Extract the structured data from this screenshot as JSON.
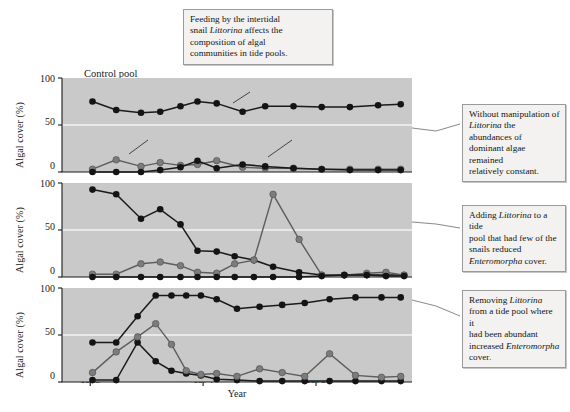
{
  "figure": {
    "caption": {
      "id": "caption-top",
      "lines": [
        {
          "text": "Feeding by the intertidal"
        },
        {
          "text": "snail ",
          "italic": "Littorina",
          "tail": " affects the"
        },
        {
          "text": "composition of algal"
        },
        {
          "text": "communities in tide pools."
        }
      ]
    },
    "notes": [
      {
        "id": "note-1",
        "lines": [
          {
            "text": "Without manipulation of"
          },
          {
            "italic": "Littorina",
            "tail": " the abundances of"
          },
          {
            "text": "dominant algae remained"
          },
          {
            "text": "relatively constant."
          }
        ]
      },
      {
        "id": "note-2",
        "lines": [
          {
            "text": "Adding ",
            "italic": "Littorina",
            "tail": " to a tide"
          },
          {
            "text": "pool that had few of the"
          },
          {
            "text": "snails reduced"
          },
          {
            "italic": "Enteromorpha",
            "tail": " cover."
          }
        ]
      },
      {
        "id": "note-3",
        "lines": [
          {
            "text": "Removing ",
            "italic": "Littorina"
          },
          {
            "text": "from a tide pool where it"
          },
          {
            "text": "had been abundant"
          },
          {
            "text": "increased ",
            "italic": "Enteromorpha"
          },
          {
            "text": "cover."
          }
        ]
      }
    ],
    "panel_title": "Control pool",
    "inline_labels": {
      "chondrus": {
        "italic": "Chondrus",
        "tail": ", an unpalatable alga"
      },
      "ephemeral": {
        "text": "Ephemeral algae"
      },
      "enteromorpha": {
        "italic": "Enteromorpha"
      }
    },
    "colors": {
      "plot_background": "#c9c9c9",
      "gridline": "#f2f2f2",
      "axis": "#1a1a1a",
      "series_dark": "#141414",
      "series_grey": "#7c7c7c",
      "box_background": "#f3f2f0",
      "box_border": "#9a9a9a"
    }
  },
  "chart_data": {
    "type": "line",
    "title": "",
    "xlabel": "Year",
    "ylabel": "Algal cover (%)",
    "ylim": [
      0,
      100
    ],
    "yticks": [
      0,
      50,
      100
    ],
    "ytick_labels": [
      "0",
      "50",
      "100"
    ],
    "xlim": [
      1972.75,
      1975.85
    ],
    "xticks": [
      1973,
      1974,
      1975
    ],
    "xtick_labels": [
      "1973",
      "1974",
      "1975"
    ],
    "grid": true,
    "legend_position": "inline-annotations",
    "panels": [
      {
        "name": "control-pool",
        "label": "Control pool",
        "series": [
          {
            "name": "Chondrus",
            "color": "dark",
            "x": [
              1973.02,
              1973.23,
              1973.45,
              1973.62,
              1973.8,
              1973.95,
              1974.12,
              1974.35,
              1974.55,
              1974.8,
              1975.05,
              1975.3,
              1975.55,
              1975.75
            ],
            "y": [
              75,
              66,
              63,
              64,
              70,
              75,
              73,
              64,
              70,
              70,
              69,
              69,
              71,
              72
            ]
          },
          {
            "name": "Ephemeral algae",
            "color": "grey",
            "x": [
              1973.02,
              1973.23,
              1973.45,
              1973.62,
              1973.8,
              1973.95,
              1974.12,
              1974.35,
              1974.55,
              1974.8,
              1975.05,
              1975.3,
              1975.55,
              1975.75
            ],
            "y": [
              3,
              13,
              6,
              10,
              7,
              8,
              12,
              5,
              4,
              4,
              3,
              3,
              3,
              3
            ]
          },
          {
            "name": "Enteromorpha",
            "color": "dark",
            "x": [
              1973.02,
              1973.23,
              1973.45,
              1973.62,
              1973.8,
              1973.95,
              1974.12,
              1974.35,
              1974.55,
              1974.8,
              1975.05,
              1975.3,
              1975.55,
              1975.75
            ],
            "y": [
              0,
              0,
              0,
              2,
              5,
              12,
              4,
              8,
              6,
              4,
              3,
              2,
              2,
              2
            ]
          }
        ]
      },
      {
        "name": "littorina-added",
        "label": "Littorina added",
        "series": [
          {
            "name": "Chondrus",
            "color": "dark",
            "x": [
              1973.02,
              1973.23,
              1973.45,
              1973.62,
              1973.8,
              1973.95,
              1974.12,
              1974.28,
              1974.45,
              1974.62,
              1974.85,
              1975.05,
              1975.25,
              1975.45,
              1975.62,
              1975.78
            ],
            "y": [
              93,
              88,
              62,
              72,
              56,
              28,
              27,
              22,
              18,
              11,
              5,
              2,
              2,
              2,
              2,
              2
            ]
          },
          {
            "name": "Enteromorpha",
            "color": "grey",
            "x": [
              1973.02,
              1973.23,
              1973.45,
              1973.62,
              1973.8,
              1973.95,
              1974.12,
              1974.28,
              1974.45,
              1974.62,
              1974.85,
              1975.05,
              1975.25,
              1975.45,
              1975.62,
              1975.78
            ],
            "y": [
              3,
              3,
              14,
              16,
              12,
              5,
              4,
              14,
              18,
              88,
              40,
              2,
              2,
              4,
              5,
              2
            ]
          },
          {
            "name": "Ephemeral algae",
            "color": "dark",
            "x": [
              1973.02,
              1973.23,
              1973.45,
              1973.62,
              1973.8,
              1973.95,
              1974.12,
              1974.28,
              1974.45,
              1974.62,
              1974.85,
              1975.05,
              1975.25,
              1975.45,
              1975.62,
              1975.78
            ],
            "y": [
              0,
              0,
              0,
              0,
              0,
              0,
              0,
              0,
              0,
              0,
              0,
              1,
              2,
              2,
              1,
              1
            ]
          }
        ]
      },
      {
        "name": "littorina-removed",
        "label": "Littorina removed",
        "series": [
          {
            "name": "Enteromorpha",
            "color": "dark",
            "x": [
              1973.02,
              1973.23,
              1973.42,
              1973.58,
              1973.72,
              1973.85,
              1973.98,
              1974.12,
              1974.3,
              1974.5,
              1974.7,
              1974.9,
              1975.12,
              1975.35,
              1975.58,
              1975.75
            ],
            "y": [
              42,
              42,
              70,
              92,
              92,
              92,
              92,
              88,
              78,
              80,
              82,
              84,
              88,
              90,
              90,
              90
            ]
          },
          {
            "name": "Chondrus",
            "color": "dark",
            "x": [
              1973.02,
              1973.23,
              1973.42,
              1973.58,
              1973.72,
              1973.85,
              1973.98,
              1974.12,
              1974.3,
              1974.5,
              1974.7,
              1974.9,
              1975.12,
              1975.35,
              1975.58,
              1975.75
            ],
            "y": [
              2,
              2,
              42,
              22,
              12,
              9,
              7,
              3,
              2,
              1,
              1,
              1,
              1,
              1,
              1,
              1
            ]
          },
          {
            "name": "Ephemeral algae",
            "color": "grey",
            "x": [
              1973.02,
              1973.23,
              1973.42,
              1973.58,
              1973.72,
              1973.85,
              1973.98,
              1974.12,
              1974.3,
              1974.5,
              1974.7,
              1974.9,
              1975.12,
              1975.35,
              1975.58,
              1975.75
            ],
            "y": [
              10,
              32,
              48,
              62,
              40,
              12,
              8,
              9,
              6,
              14,
              10,
              6,
              30,
              7,
              5,
              6
            ]
          }
        ]
      }
    ]
  }
}
